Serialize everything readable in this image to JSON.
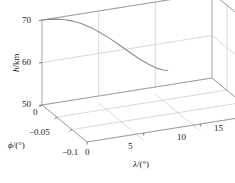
{
  "figure": {
    "kind": "3d-line-plot",
    "background": "#ffffff",
    "line_color": "#8c8c8c",
    "grid_color": "#c8c8c8",
    "axis_color": "#9a9a9a",
    "text_color": "#1a1a1a"
  },
  "axes": {
    "h": {
      "label_main": "h",
      "label_unit": "/km",
      "ticks": [
        "50",
        "60",
        "70"
      ],
      "values": [
        50,
        60,
        70
      ],
      "range": [
        50,
        70
      ]
    },
    "phi": {
      "label_main": "ϕ",
      "label_unit": "/(°)",
      "ticks": [
        "0",
        "−0.05",
        "−0.1"
      ],
      "values": [
        0,
        -0.05,
        -0.1
      ],
      "range": [
        0,
        -0.1
      ]
    },
    "lambda": {
      "label_main": "λ",
      "label_unit": "/(°)",
      "ticks": [
        "0",
        "5",
        "10",
        "15"
      ],
      "values": [
        0,
        5,
        10,
        15
      ],
      "range": [
        0,
        15
      ]
    }
  },
  "chart_data": {
    "type": "line",
    "title": "",
    "xlabel": "λ/(°)",
    "ylabel": "ϕ/(°)",
    "zlabel": "h/km",
    "xlim": [
      0,
      15
    ],
    "ylim": [
      -0.1,
      0
    ],
    "zlim": [
      50,
      70
    ],
    "grid": true,
    "legend": false,
    "series": [
      {
        "name": "trajectory",
        "color": "#8c8c8c",
        "x": [
          0.0,
          0.6,
          1.2,
          1.9,
          2.6,
          3.4,
          4.2,
          5.0,
          5.9,
          6.8,
          7.7,
          8.6,
          9.4,
          10.1,
          10.7,
          11.1
        ],
        "y": [
          0,
          0,
          0,
          0,
          0,
          0,
          0,
          0,
          0,
          0,
          0,
          0,
          0,
          0,
          0,
          0
        ],
        "z": [
          70.0,
          69.9,
          69.7,
          69.3,
          68.7,
          67.8,
          66.6,
          65.1,
          63.3,
          61.3,
          59.2,
          57.2,
          55.6,
          54.4,
          53.7,
          53.4
        ]
      }
    ]
  }
}
